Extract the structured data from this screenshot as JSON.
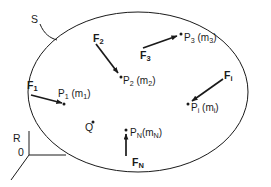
{
  "figure": {
    "stroke_color": "#1a1a1a",
    "background_color": "#ffffff",
    "boundary": {
      "name": "S",
      "label": "S",
      "shape": "ellipse"
    },
    "reference_frame": {
      "label": "R",
      "origin_label": "0"
    },
    "points": [
      {
        "id": "P1",
        "label": "P",
        "sub": "1",
        "mass_open": " (m",
        "mass_sub": "1",
        "mass_close": ")"
      },
      {
        "id": "P2",
        "label": "P",
        "sub": "2",
        "mass_open": " (m",
        "mass_sub": "2",
        "mass_close": ")"
      },
      {
        "id": "P3",
        "label": "P",
        "sub": "3",
        "mass_open": " (m",
        "mass_sub": "3",
        "mass_close": ")"
      },
      {
        "id": "Pi",
        "label": "P",
        "sub": "i",
        "mass_open": " (m",
        "mass_sub": "i",
        "mass_close": ")"
      },
      {
        "id": "PN",
        "label": "P",
        "sub": "N",
        "mass_open": "(m",
        "mass_sub": "N",
        "mass_close": ")"
      },
      {
        "id": "Q",
        "label": "Q",
        "sub": "",
        "mass_open": "",
        "mass_sub": "",
        "mass_close": ""
      }
    ],
    "forces": [
      {
        "id": "F1",
        "label": "F",
        "sub": "1"
      },
      {
        "id": "F2",
        "label": "F",
        "sub": "2"
      },
      {
        "id": "F3",
        "label": "F",
        "sub": "3"
      },
      {
        "id": "Fi",
        "label": "F",
        "sub": "i"
      },
      {
        "id": "FN",
        "label": "F",
        "sub": "N"
      }
    ]
  }
}
